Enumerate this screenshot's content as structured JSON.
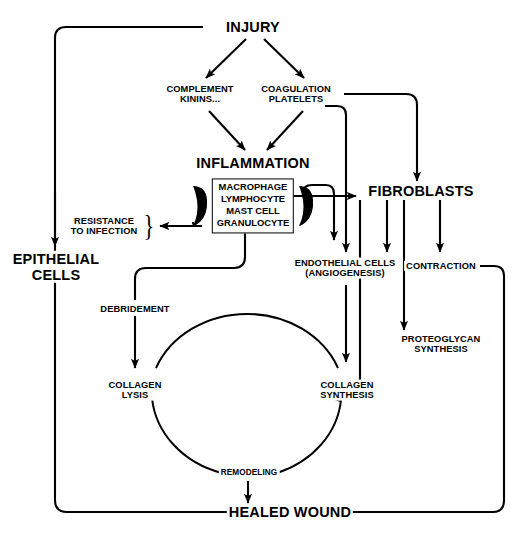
{
  "diagram": {
    "type": "flowchart",
    "background_color": "#ffffff",
    "line_color": "#000000"
  },
  "nodes": {
    "injury": "INJURY",
    "complement_l1": "COMPLEMENT",
    "complement_l2": "KININS...",
    "coagulation_l1": "COAGULATION",
    "coagulation_l2": "PLATELETS",
    "inflammation": "INFLAMMATION",
    "cellbox_l1": "MACROPHAGE",
    "cellbox_l2": "LYMPHOCYTE",
    "cellbox_l3": "MAST CELL",
    "cellbox_l4": "GRANULOCYTE",
    "resistance_l1": "RESISTANCE",
    "resistance_l2": "TO INFECTION",
    "resistance_brace": "}",
    "epithelial_l1": "EPITHELIAL",
    "epithelial_l2": "CELLS",
    "fibroblasts": "FIBROBLASTS",
    "endothelial_l1": "ENDOTHELIAL CELLS",
    "endothelial_l2": "(ANGIOGENESIS)",
    "contraction": "CONTRACTION",
    "proteoglycan_l1": "PROTEOGLYCAN",
    "proteoglycan_l2": "SYNTHESIS",
    "debridement": "DEBRIDEMENT",
    "collagen_lysis_l1": "COLLAGEN",
    "collagen_lysis_l2": "LYSIS",
    "collagen_synth_l1": "COLLAGEN",
    "collagen_synth_l2": "SYNTHESIS",
    "remodeling": "REMODELING",
    "healed_wound": "HEALED WOUND"
  }
}
